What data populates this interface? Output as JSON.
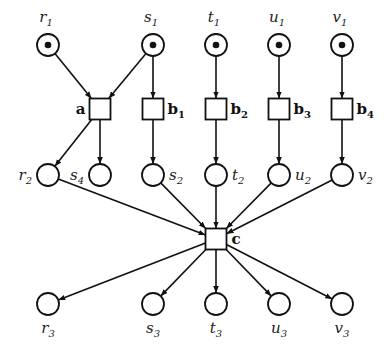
{
  "diagram": {
    "type": "petri-net",
    "places_top": [
      {
        "id": "r1",
        "base": "r",
        "sub": "1",
        "x": 48,
        "y": 45,
        "token": true
      },
      {
        "id": "s1",
        "base": "s",
        "sub": "1",
        "x": 153,
        "y": 45,
        "token": true
      },
      {
        "id": "t1",
        "base": "t",
        "sub": "1",
        "x": 216,
        "y": 45,
        "token": true
      },
      {
        "id": "u1",
        "base": "u",
        "sub": "1",
        "x": 279,
        "y": 45,
        "token": true
      },
      {
        "id": "v1",
        "base": "v",
        "sub": "1",
        "x": 342,
        "y": 45,
        "token": true
      }
    ],
    "transitions_top": [
      {
        "id": "a",
        "base": "a",
        "sub": "",
        "x": 100,
        "y": 109
      },
      {
        "id": "b1",
        "base": "b",
        "sub": "1",
        "x": 153,
        "y": 109
      },
      {
        "id": "b2",
        "base": "b",
        "sub": "2",
        "x": 216,
        "y": 109
      },
      {
        "id": "b3",
        "base": "b",
        "sub": "3",
        "x": 279,
        "y": 109
      },
      {
        "id": "b4",
        "base": "b",
        "sub": "4",
        "x": 342,
        "y": 109
      }
    ],
    "places_middle": [
      {
        "id": "r2",
        "base": "r",
        "sub": "2",
        "x": 48,
        "y": 175,
        "label_side": "left"
      },
      {
        "id": "s4",
        "base": "s",
        "sub": "4",
        "x": 100,
        "y": 175,
        "label_side": "left"
      },
      {
        "id": "s2",
        "base": "s",
        "sub": "2",
        "x": 153,
        "y": 175,
        "label_side": "right"
      },
      {
        "id": "t2",
        "base": "t",
        "sub": "2",
        "x": 216,
        "y": 175,
        "label_side": "right"
      },
      {
        "id": "u2",
        "base": "u",
        "sub": "2",
        "x": 279,
        "y": 175,
        "label_side": "right"
      },
      {
        "id": "v2",
        "base": "v",
        "sub": "2",
        "x": 342,
        "y": 175,
        "label_side": "right"
      }
    ],
    "transition_c": {
      "id": "c",
      "base": "c",
      "sub": "",
      "x": 216,
      "y": 239
    },
    "places_bottom": [
      {
        "id": "r3",
        "base": "r",
        "sub": "3",
        "x": 48,
        "y": 304
      },
      {
        "id": "s3",
        "base": "s",
        "sub": "3",
        "x": 153,
        "y": 304
      },
      {
        "id": "t3",
        "base": "t",
        "sub": "3",
        "x": 216,
        "y": 304
      },
      {
        "id": "u3",
        "base": "u",
        "sub": "3",
        "x": 279,
        "y": 304
      },
      {
        "id": "v3",
        "base": "v",
        "sub": "3",
        "x": 342,
        "y": 304
      }
    ],
    "arcs": [
      [
        "r1",
        "a"
      ],
      [
        "s1",
        "a"
      ],
      [
        "s1",
        "b1"
      ],
      [
        "t1",
        "b2"
      ],
      [
        "u1",
        "b3"
      ],
      [
        "v1",
        "b4"
      ],
      [
        "a",
        "r2"
      ],
      [
        "a",
        "s4"
      ],
      [
        "b1",
        "s2"
      ],
      [
        "b2",
        "t2"
      ],
      [
        "b3",
        "u2"
      ],
      [
        "b4",
        "v2"
      ],
      [
        "r2",
        "c"
      ],
      [
        "s2",
        "c"
      ],
      [
        "t2",
        "c"
      ],
      [
        "u2",
        "c"
      ],
      [
        "v2",
        "c"
      ],
      [
        "c",
        "r3"
      ],
      [
        "c",
        "s3"
      ],
      [
        "c",
        "t3"
      ],
      [
        "c",
        "u3"
      ],
      [
        "c",
        "v3"
      ]
    ],
    "style": {
      "stroke": "#111111",
      "place_radius": 11,
      "transition_size": 21
    }
  }
}
